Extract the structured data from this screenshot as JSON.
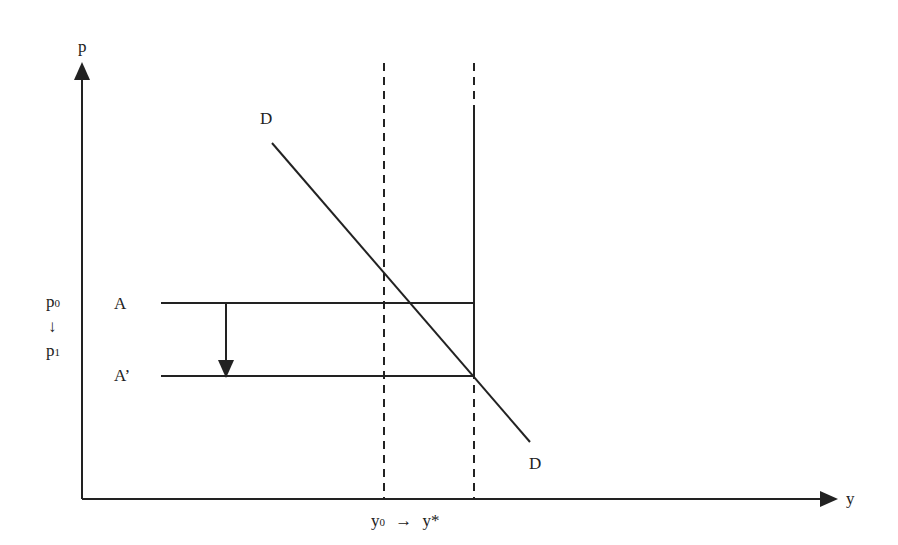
{
  "diagram": {
    "axes": {
      "y_axis_label": "p",
      "x_axis_label": "y"
    },
    "curves": {
      "demand_label_top": "D",
      "demand_label_bottom": "D"
    },
    "price_levels": {
      "p0": {
        "base": "p",
        "sub": "0"
      },
      "arrow": "↓",
      "p1": {
        "base": "p",
        "sub": "1"
      }
    },
    "lines": {
      "A_label": "A",
      "A_prime_label": "A’"
    },
    "quantities": {
      "y0": {
        "base": "y",
        "sub": "0"
      },
      "arrow": "→",
      "y_star": "y*"
    },
    "colors": {
      "ink": "#222222",
      "background": "#ffffff"
    }
  }
}
